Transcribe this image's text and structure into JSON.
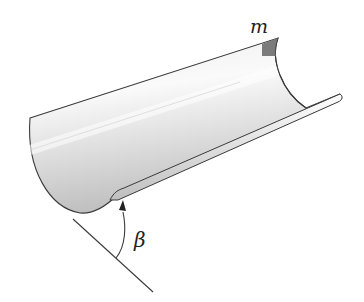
{
  "diagram": {
    "labels": {
      "mass": "m",
      "angle": "β"
    },
    "colors": {
      "outline": "#3a3a3a",
      "surface_light": "#f4f4f4",
      "surface_mid": "#d8d8d8",
      "surface_dark": "#b5b5b5",
      "mass_patch": "#6e6e6e"
    }
  }
}
